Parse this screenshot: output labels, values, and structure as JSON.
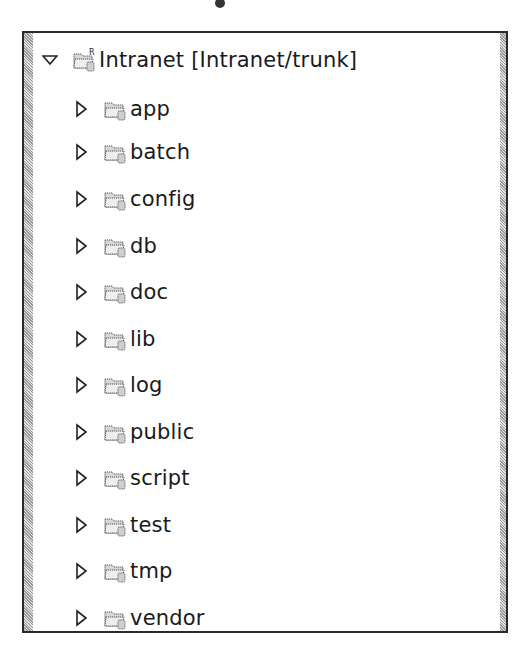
{
  "tree": {
    "root": {
      "label": "Intranet [Intranet/trunk]",
      "expanded": true,
      "icon": "project-folder-icon"
    },
    "children": [
      {
        "label": "app",
        "expanded": false,
        "icon": "folder-icon"
      },
      {
        "label": "batch",
        "expanded": false,
        "icon": "folder-icon"
      },
      {
        "label": "config",
        "expanded": false,
        "icon": "folder-icon"
      },
      {
        "label": "db",
        "expanded": false,
        "icon": "folder-icon"
      },
      {
        "label": "doc",
        "expanded": false,
        "icon": "folder-icon"
      },
      {
        "label": "lib",
        "expanded": false,
        "icon": "folder-icon"
      },
      {
        "label": "log",
        "expanded": false,
        "icon": "folder-icon"
      },
      {
        "label": "public",
        "expanded": false,
        "icon": "folder-icon"
      },
      {
        "label": "script",
        "expanded": false,
        "icon": "folder-icon"
      },
      {
        "label": "test",
        "expanded": false,
        "icon": "folder-icon"
      },
      {
        "label": "tmp",
        "expanded": false,
        "icon": "folder-icon"
      },
      {
        "label": "vendor",
        "expanded": false,
        "icon": "folder-icon"
      }
    ]
  }
}
